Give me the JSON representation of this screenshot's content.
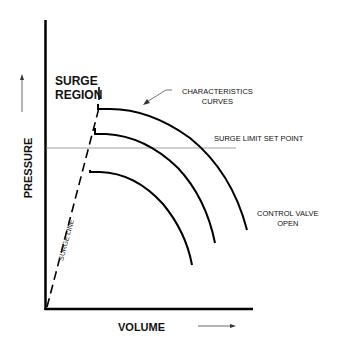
{
  "diagram": {
    "axes": {
      "y_label": "PRESSURE",
      "x_label": "VOLUME"
    },
    "labels": {
      "surge_region": [
        "SURGE",
        "REGION"
      ],
      "characteristics_curves": [
        "CHARACTERISTICS",
        "CURVES"
      ],
      "surge_limit_set_point": "SURGE LIMIT SET POINT",
      "control_valve_open": [
        "CONTROL VALVE",
        "OPEN"
      ],
      "surge_line": "SURGE LINE"
    },
    "elements": [
      {
        "name": "y-axis",
        "type": "solid-line"
      },
      {
        "name": "x-axis",
        "type": "solid-line"
      },
      {
        "name": "surge-line",
        "type": "dashed-line"
      },
      {
        "name": "surge-limit-set-point-line",
        "type": "thin-horizontal-line"
      },
      {
        "name": "characteristic-curve-1",
        "type": "curve"
      },
      {
        "name": "characteristic-curve-2",
        "type": "curve"
      },
      {
        "name": "characteristic-curve-3",
        "type": "curve"
      },
      {
        "name": "pressure-arrow",
        "type": "arrow",
        "direction": "up"
      },
      {
        "name": "volume-arrow",
        "type": "arrow",
        "direction": "right"
      },
      {
        "name": "characteristics-pointer-arrow",
        "type": "arrow"
      }
    ],
    "colors": {
      "line": "#000000",
      "thin_line": "#777777",
      "background": "#ffffff"
    }
  }
}
